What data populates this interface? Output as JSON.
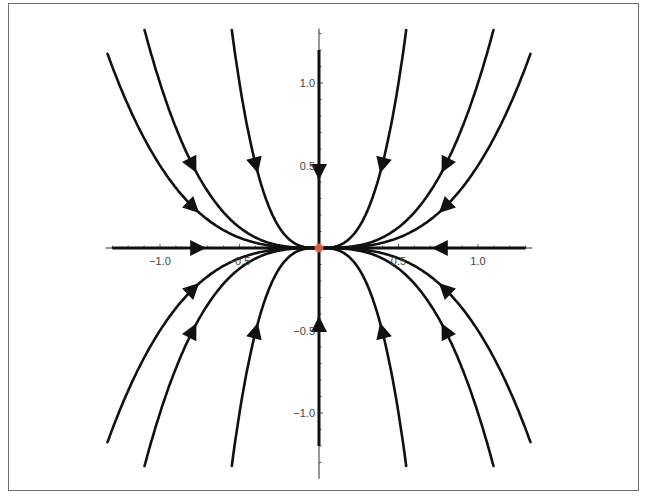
{
  "chart_data": {
    "type": "line",
    "subtype": "phase-portrait",
    "title": "",
    "xlabel": "",
    "ylabel": "",
    "xlim": [
      -1.33,
      1.33
    ],
    "ylim": [
      -1.35,
      1.33
    ],
    "grid": false,
    "legend": null,
    "x_ticks": [
      {
        "value": -1.0,
        "label": "−1.0"
      },
      {
        "value": -0.5,
        "label": "−0.5"
      },
      {
        "value": 0.5,
        "label": "0.5"
      },
      {
        "value": 1.0,
        "label": "1.0"
      }
    ],
    "y_ticks": [
      {
        "value": 1.0,
        "label": "1.0"
      },
      {
        "value": 0.5,
        "label": "0.5"
      },
      {
        "value": -0.5,
        "label": "−0.5"
      },
      {
        "value": -1.0,
        "label": "−1.0"
      }
    ],
    "minor_tick_step": 0.1,
    "trajectory_family": "y = c * x^3 (flow toward origin)",
    "trajectories": [
      {
        "name": "c=8",
        "c": 8,
        "arrow_y_abs": 0.5
      },
      {
        "name": "c=1",
        "c": 1,
        "arrow_y_abs": 0.5
      },
      {
        "name": "c=0.5",
        "c": 0.5,
        "arrow_x_abs": 0.79
      },
      {
        "name": "c=-8",
        "c": -8,
        "arrow_y_abs": 0.5
      },
      {
        "name": "c=-1",
        "c": -1,
        "arrow_y_abs": 0.5
      },
      {
        "name": "c=-0.5",
        "c": -0.5,
        "arrow_x_abs": 0.79
      }
    ],
    "axis_trajectories": [
      {
        "name": "x-axis",
        "from": -1.3,
        "to": 1.3,
        "arrows_at": [
          -0.76,
          0.76
        ]
      },
      {
        "name": "y-axis",
        "from": -1.2,
        "to": 1.2,
        "arrows_at": [
          -0.46,
          0.46
        ]
      }
    ],
    "equilibrium": {
      "x": 0,
      "y": 0,
      "color": "#e8704f"
    },
    "colors": {
      "trajectory": "#111111",
      "axis": "#333333",
      "frame": "#6f6f6f",
      "label": "#444444"
    }
  }
}
